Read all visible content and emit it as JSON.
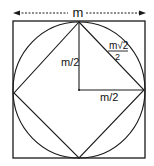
{
  "diagram": {
    "colors": {
      "stroke": "#1a1a1a",
      "background": "#ffffff"
    },
    "dimension_arrow": {
      "label": "m"
    },
    "labels": {
      "vertical_radius": "m/2",
      "horizontal_radius": "m/2",
      "inner_side_numerator": "m√2",
      "inner_side_denominator": "2"
    },
    "shapes": {
      "outer_square": {
        "side": "m"
      },
      "circle": {
        "radius": "m/2"
      },
      "inner_square": {
        "side": "m√2/2"
      }
    }
  }
}
